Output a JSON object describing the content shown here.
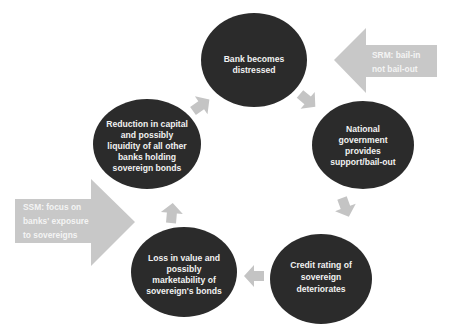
{
  "diagram": {
    "type": "cycle",
    "colors": {
      "node_fill": "#2b2b2b",
      "arrow_fill": "#c4c4c4",
      "side_arrow_fill": "#c8c8c8",
      "text": "#f2f2f2"
    },
    "nodes": [
      {
        "id": "n1",
        "lines": [
          "Bank becomes",
          "distressed"
        ]
      },
      {
        "id": "n2",
        "lines": [
          "National",
          "government",
          "provides",
          "support/bail-out"
        ]
      },
      {
        "id": "n3",
        "lines": [
          "Credit rating of",
          "sovereign",
          "deteriorates"
        ]
      },
      {
        "id": "n4",
        "lines": [
          "Loss in value and",
          "possibly",
          "marketability of",
          "sovereign's bonds"
        ]
      },
      {
        "id": "n5",
        "lines": [
          "Reduction in capital",
          "and possibly",
          "liquidity of all other",
          "banks holding",
          "sovereign bonds"
        ]
      }
    ],
    "side_arrows": [
      {
        "id": "srm",
        "direction": "left",
        "lines": [
          "SRM: bail-in",
          "not bail-out"
        ]
      },
      {
        "id": "ssm",
        "direction": "right",
        "lines": [
          "SSM: focus on",
          "banks' exposure",
          "to sovereigns"
        ]
      }
    ]
  }
}
